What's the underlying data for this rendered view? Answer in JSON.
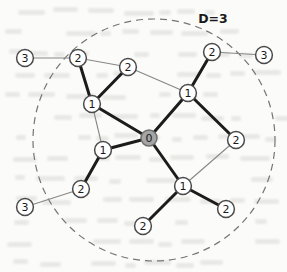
{
  "figure": {
    "annotation": "D=3",
    "boundary": {
      "cx": 154,
      "cy": 140,
      "r": 121
    },
    "colors": {
      "node_fill": "#ffffff",
      "node_stroke": "#4a4a4a",
      "center_node_fill": "#a5a5a5",
      "center_node_stroke": "#6e6e6e",
      "edge_thick": "#1c1c1c",
      "edge_thin": "#878787",
      "boundary_stroke": "#757575",
      "label_color": "#1a1a1a",
      "annotation_color": "#1a1a1a"
    },
    "nodes": [
      {
        "id": "n3a",
        "label": "3",
        "x": 25,
        "y": 58,
        "center": false
      },
      {
        "id": "n2a",
        "label": "2",
        "x": 78,
        "y": 58,
        "center": false
      },
      {
        "id": "n2b",
        "label": "2",
        "x": 128,
        "y": 67,
        "center": false
      },
      {
        "id": "n2c",
        "label": "2",
        "x": 212,
        "y": 52,
        "center": false
      },
      {
        "id": "n3b",
        "label": "3",
        "x": 264,
        "y": 55,
        "center": false
      },
      {
        "id": "n1a",
        "label": "1",
        "x": 92,
        "y": 104,
        "center": false
      },
      {
        "id": "n1b",
        "label": "1",
        "x": 188,
        "y": 93,
        "center": false
      },
      {
        "id": "n0",
        "label": "0",
        "x": 149,
        "y": 138,
        "center": true
      },
      {
        "id": "n2d",
        "label": "2",
        "x": 236,
        "y": 140,
        "center": false
      },
      {
        "id": "n1c",
        "label": "1",
        "x": 103,
        "y": 150,
        "center": false
      },
      {
        "id": "n2e",
        "label": "2",
        "x": 81,
        "y": 189,
        "center": false
      },
      {
        "id": "n3c",
        "label": "3",
        "x": 25,
        "y": 207,
        "center": false
      },
      {
        "id": "n1d",
        "label": "1",
        "x": 183,
        "y": 186,
        "center": false
      },
      {
        "id": "n2f",
        "label": "2",
        "x": 143,
        "y": 226,
        "center": false
      },
      {
        "id": "n2g",
        "label": "2",
        "x": 226,
        "y": 209,
        "center": false
      }
    ],
    "edges": [
      {
        "from": "n3a",
        "to": "n2a",
        "weight": "thin"
      },
      {
        "from": "n2a",
        "to": "n2b",
        "weight": "thin"
      },
      {
        "from": "n2b",
        "to": "n1b",
        "weight": "thin"
      },
      {
        "from": "n2c",
        "to": "n3b",
        "weight": "thin"
      },
      {
        "from": "n1a",
        "to": "n1c",
        "weight": "thin"
      },
      {
        "from": "n2e",
        "to": "n3c",
        "weight": "thin"
      },
      {
        "from": "n2d",
        "to": "n1d",
        "weight": "thin"
      },
      {
        "from": "n2a",
        "to": "n1a",
        "weight": "thick"
      },
      {
        "from": "n2b",
        "to": "n1a",
        "weight": "thick"
      },
      {
        "from": "n1a",
        "to": "n0",
        "weight": "thick"
      },
      {
        "from": "n2c",
        "to": "n1b",
        "weight": "thick"
      },
      {
        "from": "n1b",
        "to": "n0",
        "weight": "thick"
      },
      {
        "from": "n1b",
        "to": "n2d",
        "weight": "thick"
      },
      {
        "from": "n0",
        "to": "n1c",
        "weight": "thick"
      },
      {
        "from": "n0",
        "to": "n1d",
        "weight": "thick"
      },
      {
        "from": "n1c",
        "to": "n2e",
        "weight": "thick"
      },
      {
        "from": "n1d",
        "to": "n2f",
        "weight": "thick"
      },
      {
        "from": "n1d",
        "to": "n2g",
        "weight": "thick"
      }
    ]
  }
}
